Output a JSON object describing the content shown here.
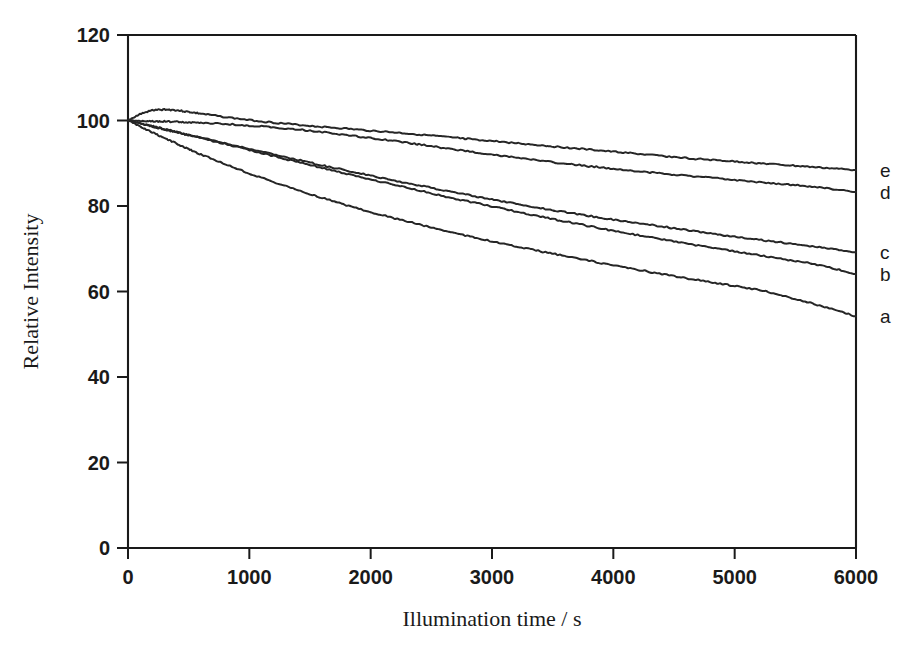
{
  "chart_data": {
    "type": "line",
    "title": "",
    "xlabel": "Illumination time / s",
    "ylabel": "Relative Intensity",
    "xlim": [
      0,
      6000
    ],
    "ylim": [
      0,
      120
    ],
    "xticks": [
      0,
      1000,
      2000,
      3000,
      4000,
      5000,
      6000
    ],
    "yticks": [
      0,
      20,
      40,
      60,
      80,
      100,
      120
    ],
    "xticklabels": [
      "0",
      "1000",
      "2000",
      "3000",
      "4000",
      "5000",
      "6000"
    ],
    "yticklabels": [
      "0",
      "20",
      "40",
      "60",
      "80",
      "100",
      "120"
    ],
    "grid": false,
    "legend": "right-inline-labels",
    "x": [
      0,
      100,
      200,
      300,
      400,
      500,
      600,
      800,
      1000,
      1200,
      1400,
      1600,
      1800,
      2000,
      2200,
      2400,
      2600,
      2800,
      3000,
      3200,
      3400,
      3600,
      3800,
      4000,
      4200,
      4400,
      4600,
      4800,
      5000,
      5200,
      5400,
      5600,
      5800,
      6000
    ],
    "series": [
      {
        "name": "a",
        "label": "a",
        "values": [
          100.0,
          98.6,
          97.2,
          95.9,
          94.6,
          93.3,
          92.1,
          89.8,
          87.6,
          85.6,
          83.7,
          81.9,
          80.2,
          78.6,
          77.1,
          75.7,
          74.3,
          73.0,
          71.7,
          70.5,
          69.4,
          68.3,
          67.2,
          66.1,
          65.1,
          64.1,
          63.1,
          62.2,
          61.3,
          60.4,
          59.0,
          57.5,
          55.9,
          54.2
        ]
      },
      {
        "name": "b",
        "label": "b",
        "values": [
          100.0,
          99.4,
          98.7,
          98.0,
          97.3,
          96.6,
          95.9,
          94.5,
          93.1,
          91.7,
          90.3,
          88.9,
          87.5,
          86.2,
          84.9,
          83.6,
          82.3,
          81.1,
          79.9,
          78.7,
          77.5,
          76.4,
          75.3,
          74.2,
          73.2,
          72.2,
          71.2,
          70.3,
          69.4,
          68.5,
          67.6,
          66.7,
          65.5,
          64.1
        ]
      },
      {
        "name": "c",
        "label": "c",
        "values": [
          100.0,
          99.3,
          98.6,
          97.9,
          97.3,
          96.6,
          96.0,
          94.7,
          93.4,
          92.1,
          90.8,
          89.5,
          88.3,
          87.1,
          85.9,
          84.8,
          83.7,
          82.6,
          81.5,
          80.5,
          79.5,
          78.6,
          77.7,
          76.8,
          76.0,
          75.2,
          74.4,
          73.6,
          72.8,
          72.1,
          71.4,
          70.7,
          70.0,
          69.2
        ]
      },
      {
        "name": "d",
        "label": "d",
        "values": [
          100.0,
          99.9,
          99.8,
          99.8,
          99.7,
          99.6,
          99.5,
          99.2,
          98.8,
          98.4,
          97.9,
          97.3,
          96.6,
          95.9,
          95.2,
          94.4,
          93.6,
          92.8,
          92.0,
          91.3,
          90.6,
          89.9,
          89.3,
          88.7,
          88.1,
          87.6,
          87.1,
          86.6,
          86.1,
          85.6,
          85.1,
          84.6,
          84.0,
          83.3
        ]
      },
      {
        "name": "e",
        "label": "e",
        "values": [
          100.0,
          101.5,
          102.4,
          102.6,
          102.4,
          102.0,
          101.6,
          100.8,
          100.1,
          99.5,
          99.0,
          98.5,
          98.1,
          97.6,
          97.2,
          96.7,
          96.2,
          95.7,
          95.2,
          94.7,
          94.2,
          93.7,
          93.2,
          92.7,
          92.2,
          91.7,
          91.2,
          90.8,
          90.4,
          90.0,
          89.6,
          89.2,
          88.8,
          88.4
        ]
      }
    ],
    "series_end_labels": [
      {
        "label": "e",
        "y": 88.4
      },
      {
        "label": "d",
        "y": 83.3
      },
      {
        "label": "c",
        "y": 69.2
      },
      {
        "label": "b",
        "y": 64.1
      },
      {
        "label": "a",
        "y": 54.2
      }
    ],
    "colors": {
      "curve": "#262626",
      "axis": "#1a1a1a",
      "background": "#ffffff"
    }
  }
}
